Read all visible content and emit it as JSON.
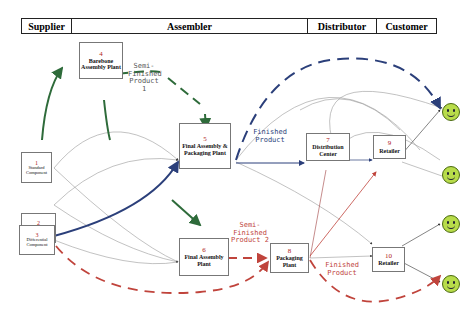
{
  "header": {
    "columns": [
      {
        "label": "Supplier"
      },
      {
        "label": "Assembler"
      },
      {
        "label": "Distributor"
      },
      {
        "label": "Customer"
      }
    ]
  },
  "nodes": {
    "n1": {
      "num": "1",
      "name": "Standard Component"
    },
    "n2": {
      "num": "2",
      "name": "Crucial Component"
    },
    "n3": {
      "num": "3",
      "name": "Differential Component"
    },
    "n4": {
      "num": "4",
      "name": "Barebone Assembly Plant"
    },
    "n5": {
      "num": "5",
      "name": "Final Assembly & Packaging Plant"
    },
    "n6": {
      "num": "6",
      "name": "Final Assembly Plant"
    },
    "n7": {
      "num": "7",
      "name": "Distribution Center"
    },
    "n8": {
      "num": "8",
      "name": "Packaging Plant"
    },
    "n9": {
      "num": "9",
      "name": "Retailer"
    },
    "n10": {
      "num": "10",
      "name": "Retailer"
    }
  },
  "labels": {
    "semi1": "Semi-\nFinished\nProduct\n1",
    "semi2": "Semi-\nFinished\nProduct 2",
    "finished_blue": "Finished\nProduct",
    "finished_red": "Finished\nProduct"
  },
  "colors": {
    "green": "#2e6b3a",
    "blue": "#2b3f7a",
    "red": "#c0443c",
    "gray": "#888888",
    "face": "#b8dc4a"
  },
  "customers": [
    {
      "id": "customer-1"
    },
    {
      "id": "customer-2"
    },
    {
      "id": "customer-3"
    },
    {
      "id": "customer-4"
    }
  ]
}
